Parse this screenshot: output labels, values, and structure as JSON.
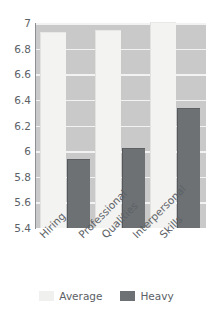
{
  "chart_data": {
    "type": "bar",
    "title": "",
    "subtitle": "",
    "xlabel": "",
    "ylabel": "",
    "categories": [
      "Hiring",
      "Professional Qualities",
      "Interpersonal Skills"
    ],
    "series": [
      {
        "name": "Average",
        "values": [
          6.92,
          6.94,
          7.0
        ],
        "color": "#f0f0ee"
      },
      {
        "name": "Heavy",
        "values": [
          5.93,
          6.02,
          6.33
        ],
        "color": "#6e7174"
      }
    ],
    "ylim": [
      5.4,
      7.0
    ],
    "ytick_step": 0.2,
    "yticks": [
      "7",
      "6.8",
      "6.6",
      "6.4",
      "6.2",
      "6",
      "5.8",
      "5.6",
      "5.4"
    ],
    "ytick_values": [
      7,
      6.8,
      6.6,
      6.4,
      6.2,
      6,
      5.8,
      5.6,
      5.4
    ],
    "grid": true,
    "grid_color": "#f2f2f2",
    "plot_background": "#c9c9c9",
    "legend_position": "bottom",
    "xtick_rotation": -45
  },
  "axis": {
    "t0": "7",
    "t1": "6.8",
    "t2": "6.6",
    "t3": "6.4",
    "t4": "6.2",
    "t5": "6",
    "t6": "5.8",
    "t7": "5.6",
    "t8": "5.4"
  },
  "xlabels": {
    "c0_l0": "Hiring",
    "c1_l0": "Professional",
    "c1_l1": "Qualities",
    "c2_l0": "Interpersonal",
    "c2_l1": "Skills"
  },
  "legend": {
    "average_label": "Average",
    "heavy_label": "Heavy"
  }
}
